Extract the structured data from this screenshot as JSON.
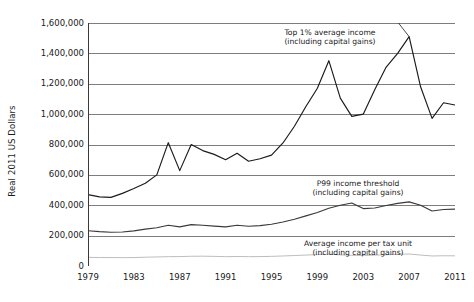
{
  "chart_data": {
    "type": "line",
    "title": "",
    "xlabel": "",
    "ylabel": "Real 2011 US Dollars",
    "xlim": [
      1979,
      2011
    ],
    "ylim": [
      0,
      1600000
    ],
    "grid": true,
    "legend_position": "inline-annotations",
    "y_ticks": [
      "0",
      "200,000",
      "400,000",
      "600,000",
      "800,000",
      "1,000,000",
      "1,200,000",
      "1,400,000",
      "1,600,000"
    ],
    "y_tick_values": [
      0,
      200000,
      400000,
      600000,
      800000,
      1000000,
      1200000,
      1400000,
      1600000
    ],
    "x_ticks": [
      "1979",
      "1983",
      "1987",
      "1991",
      "1995",
      "1999",
      "2003",
      "2007",
      "2011"
    ],
    "x_tick_values": [
      1979,
      1983,
      1987,
      1991,
      1995,
      1999,
      2003,
      2007,
      2011
    ],
    "x": [
      1979,
      1980,
      1981,
      1982,
      1983,
      1984,
      1985,
      1986,
      1987,
      1988,
      1989,
      1990,
      1991,
      1992,
      1993,
      1994,
      1995,
      1996,
      1997,
      1998,
      1999,
      2000,
      2001,
      2002,
      2003,
      2004,
      2005,
      2006,
      2007,
      2008,
      2009,
      2010,
      2011
    ],
    "series": [
      {
        "name": "Top 1% average income (including capital gains)",
        "color": "#1a1a1a",
        "values": [
          470000,
          455000,
          452000,
          478000,
          510000,
          545000,
          600000,
          812000,
          628000,
          800000,
          760000,
          735000,
          700000,
          742000,
          690000,
          706000,
          730000,
          810000,
          920000,
          1050000,
          1170000,
          1352000,
          1105000,
          985000,
          1000000,
          1160000,
          1310000,
          1400000,
          1510000,
          1180000,
          972000,
          1075000,
          1060000
        ]
      },
      {
        "name": "P99 income threshold (including capital gains)",
        "color": "#3a3a3a",
        "values": [
          232000,
          226000,
          222000,
          224000,
          231000,
          243000,
          252000,
          268000,
          258000,
          272000,
          268000,
          263000,
          258000,
          268000,
          262000,
          266000,
          275000,
          290000,
          308000,
          330000,
          352000,
          380000,
          400000,
          415000,
          378000,
          382000,
          398000,
          412000,
          422000,
          400000,
          362000,
          372000,
          375000
        ]
      },
      {
        "name": "Average income per tax unit (including capital gains)",
        "color": "#b5b5b5",
        "values": [
          57000,
          56000,
          55500,
          55000,
          55500,
          58000,
          59500,
          61500,
          62000,
          64000,
          64500,
          63500,
          61500,
          62500,
          61500,
          62000,
          63500,
          66000,
          69000,
          72000,
          75000,
          78000,
          73000,
          70000,
          69500,
          71500,
          74000,
          77000,
          79000,
          72000,
          66000,
          67500,
          67000
        ]
      }
    ],
    "annotations": [
      {
        "id": "top1",
        "line1": "Top 1% average income",
        "line2": "(including capital gains)",
        "points_to_series": "Top 1% average income (including capital gains)"
      },
      {
        "id": "p99",
        "line1": "P99 income threshold",
        "line2": "(including capital gains)",
        "points_to_series": "P99 income threshold (including capital gains)"
      },
      {
        "id": "avg",
        "line1": "Average income per tax unit",
        "line2": "(including capital gains)",
        "points_to_series": "Average income per tax unit (including capital gains)"
      }
    ]
  },
  "colors": {
    "background": "#ffffff",
    "axis": "#3a3a3a",
    "gridline": "#6e6e6e",
    "text": "#1a1a1a"
  }
}
